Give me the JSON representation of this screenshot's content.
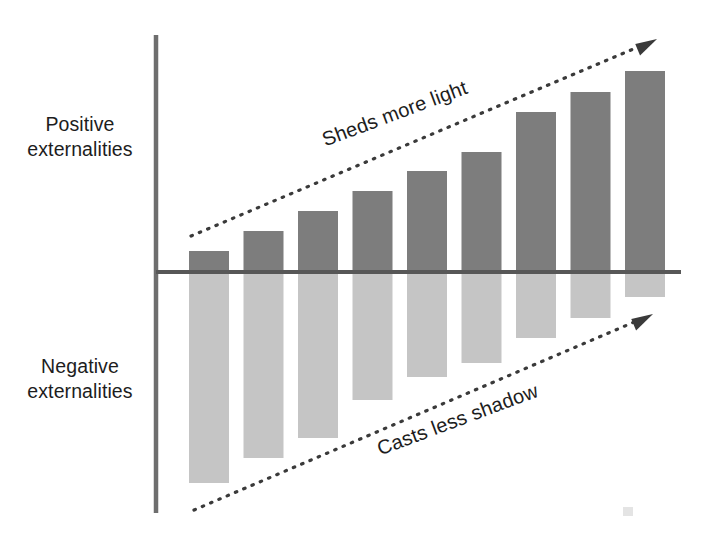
{
  "labels": {
    "positive": "Positive\nexternalities",
    "negative": "Negative\nexternalities"
  },
  "annotations": {
    "top": "Sheds more light",
    "bottom": "Casts less shadow"
  },
  "colors": {
    "positive_bar": "#7d7d7d",
    "negative_bar": "#c5c5c5",
    "axis": "#6e6e6e",
    "baseline": "#575757",
    "arrow": "#3a3a3a",
    "text": "#1d1d1d",
    "background": "#ffffff"
  },
  "chart_data": {
    "type": "bar",
    "title": "",
    "subtitle": "",
    "xlabel": "",
    "ylabel": "",
    "orientation": "vertical",
    "grid": false,
    "legend": false,
    "legend_position": "none",
    "axis_tick_labels": [],
    "categories": [
      "1",
      "2",
      "3",
      "4",
      "5",
      "6",
      "7",
      "8",
      "9"
    ],
    "series": [
      {
        "name": "Positive externalities",
        "color": "#7d7d7d",
        "values": [
          21,
          41,
          61,
          81,
          101,
          120,
          160,
          180,
          201
        ]
      },
      {
        "name": "Negative externalities",
        "color": "#c5c5c5",
        "values": [
          -211,
          -186,
          -166,
          -128,
          -105,
          -91,
          -66,
          -46,
          -25
        ]
      }
    ],
    "ylim": [
      -240,
      240
    ],
    "annotations": [
      {
        "text": "Sheds more light",
        "kind": "trend-arrow",
        "direction": "up-right",
        "region": "positive"
      },
      {
        "text": "Casts less shadow",
        "kind": "trend-arrow",
        "direction": "up-right",
        "region": "negative"
      }
    ]
  },
  "geometry": {
    "axis_x": 156,
    "axis_top": 35,
    "axis_bottom": 513,
    "baseline_y": 272,
    "baseline_x_end": 681,
    "bar_width": 40,
    "bar_pitch": 54.5,
    "bar_start_x": 189,
    "arrow_top": {
      "x1": 191,
      "y1": 236,
      "x2": 657,
      "y2": 39
    },
    "arrow_bottom": {
      "x1": 194,
      "y1": 510,
      "x2": 653,
      "y2": 314
    }
  }
}
